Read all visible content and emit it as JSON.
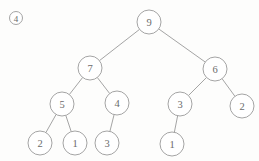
{
  "figure": {
    "marker_label": "4",
    "marker_x": 16,
    "marker_y": 18,
    "marker_radius": 6.5,
    "caption": "",
    "background_color": "#fdfdfc",
    "stroke_color": "#9a9a9a",
    "text_color": "#6b6b6b",
    "node_radius": 12,
    "width": 259,
    "height": 161
  },
  "chart_data": {
    "type": "diagram",
    "diagram_kind": "binary-tree",
    "title": "",
    "nodes": [
      {
        "id": "n0",
        "label": "9",
        "x": 149,
        "y": 22,
        "depth": 0
      },
      {
        "id": "n1",
        "label": "7",
        "x": 90,
        "y": 68,
        "depth": 1
      },
      {
        "id": "n2",
        "label": "6",
        "x": 215,
        "y": 69,
        "depth": 1
      },
      {
        "id": "n3",
        "label": "5",
        "x": 62,
        "y": 104,
        "depth": 2
      },
      {
        "id": "n4",
        "label": "4",
        "x": 117,
        "y": 103,
        "depth": 2
      },
      {
        "id": "n5",
        "label": "3",
        "x": 180,
        "y": 104,
        "depth": 2
      },
      {
        "id": "n6",
        "label": "2",
        "x": 242,
        "y": 106,
        "depth": 2
      },
      {
        "id": "n7",
        "label": "2",
        "x": 40,
        "y": 143,
        "depth": 3
      },
      {
        "id": "n8",
        "label": "1",
        "x": 75,
        "y": 143,
        "depth": 3
      },
      {
        "id": "n9",
        "label": "3",
        "x": 107,
        "y": 143,
        "depth": 3
      },
      {
        "id": "n10",
        "label": "1",
        "x": 172,
        "y": 144,
        "depth": 3
      }
    ],
    "edges": [
      {
        "from": "n0",
        "to": "n1",
        "side": "left"
      },
      {
        "from": "n0",
        "to": "n2",
        "side": "right"
      },
      {
        "from": "n1",
        "to": "n3",
        "side": "left"
      },
      {
        "from": "n1",
        "to": "n4",
        "side": "right"
      },
      {
        "from": "n2",
        "to": "n5",
        "side": "left"
      },
      {
        "from": "n2",
        "to": "n6",
        "side": "right"
      },
      {
        "from": "n3",
        "to": "n7",
        "side": "left"
      },
      {
        "from": "n3",
        "to": "n8",
        "side": "right"
      },
      {
        "from": "n4",
        "to": "n9",
        "side": "left"
      },
      {
        "from": "n5",
        "to": "n10",
        "side": "left"
      }
    ]
  }
}
